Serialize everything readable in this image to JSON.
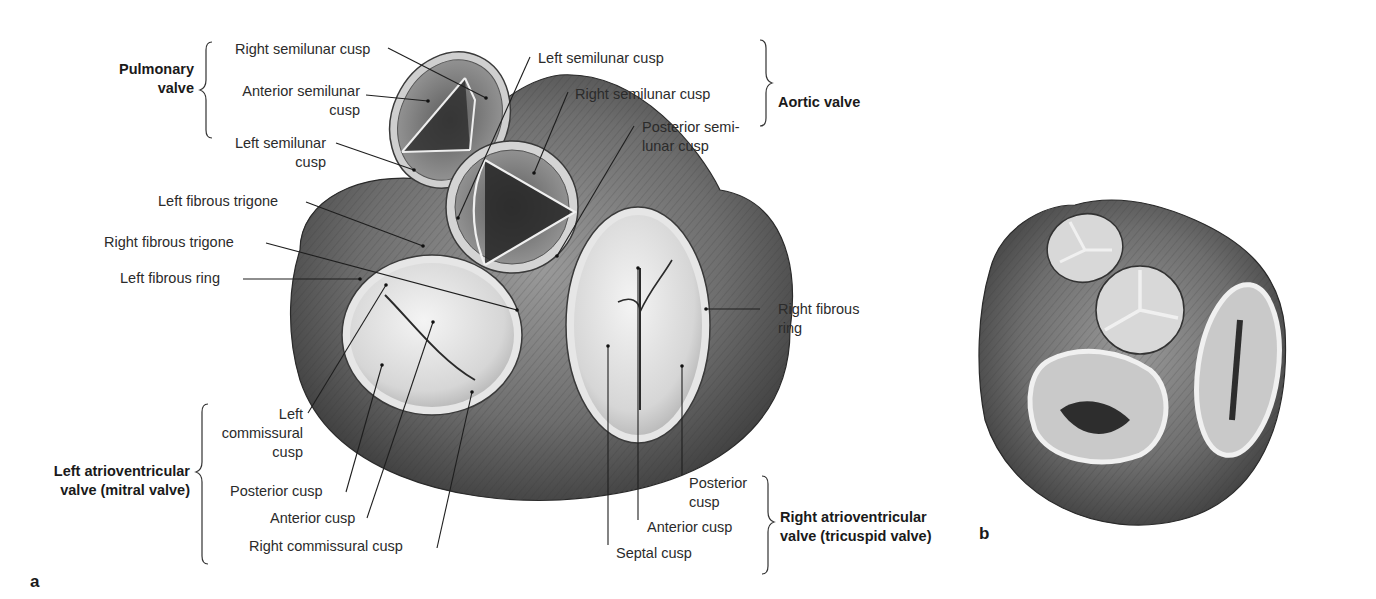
{
  "figure": {
    "panel_a_label": "a",
    "panel_b_label": "b"
  },
  "groups": {
    "pulmonary": [
      "Pulmonary",
      "valve"
    ],
    "aortic": "Aortic valve",
    "mitral": [
      "Left atrioventricular",
      "valve (mitral valve)"
    ],
    "tricuspid": [
      "Right atrioventricular",
      "valve (tricuspid valve)"
    ]
  },
  "labels": {
    "pulm_right_semilunar": "Right semilunar cusp",
    "pulm_anterior_semilunar": [
      "Anterior semilunar",
      "cusp"
    ],
    "pulm_left_semilunar": [
      "Left semilunar",
      "cusp"
    ],
    "aortic_left_semilunar": "Left semilunar cusp",
    "aortic_right_semilunar": "Right semilunar cusp",
    "aortic_posterior_semilunar": [
      "Posterior semi-",
      "lunar cusp"
    ],
    "left_fibrous_trigone": "Left fibrous trigone",
    "right_fibrous_trigone": "Right fibrous trigone",
    "left_fibrous_ring": "Left fibrous ring",
    "right_fibrous_ring": [
      "Right fibrous",
      "ring"
    ],
    "mitral_left_commissural": [
      "Left",
      "commissural",
      "cusp"
    ],
    "mitral_posterior": "Posterior cusp",
    "mitral_anterior": "Anterior cusp",
    "mitral_right_commissural": "Right commissural cusp",
    "tri_posterior": [
      "Posterior",
      "cusp"
    ],
    "tri_anterior": "Anterior cusp",
    "tri_septal": "Septal cusp"
  }
}
